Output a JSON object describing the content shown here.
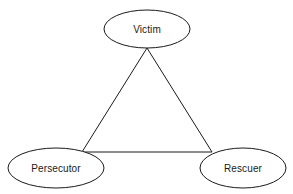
{
  "diagram": {
    "type": "triangle-relationship-diagram",
    "background_color": "#ffffff",
    "stroke_color": "#1a1a1a",
    "fill_color": "#ffffff",
    "nodes": [
      {
        "id": "victim",
        "label": "Victim",
        "shape": "ellipse",
        "cx": 147,
        "cy": 29,
        "rx": 43,
        "ry": 19
      },
      {
        "id": "persecutor",
        "label": "Persecutor",
        "shape": "ellipse",
        "cx": 56,
        "cy": 168,
        "rx": 48,
        "ry": 20
      },
      {
        "id": "rescuer",
        "label": "Rescuer",
        "shape": "ellipse",
        "cx": 243,
        "cy": 168,
        "rx": 43,
        "ry": 20
      }
    ],
    "edges": [
      {
        "id": "victim-persecutor",
        "from": "victim",
        "to": "persecutor",
        "points": "147,48 82,152"
      },
      {
        "id": "persecutor-rescuer",
        "from": "persecutor",
        "to": "rescuer",
        "points": "82,152 212,152"
      },
      {
        "id": "rescuer-victim",
        "from": "rescuer",
        "to": "victim",
        "points": "212,152 147,48"
      }
    ],
    "triangle_path": "M147,48 L82,152 L212,152 Z"
  }
}
